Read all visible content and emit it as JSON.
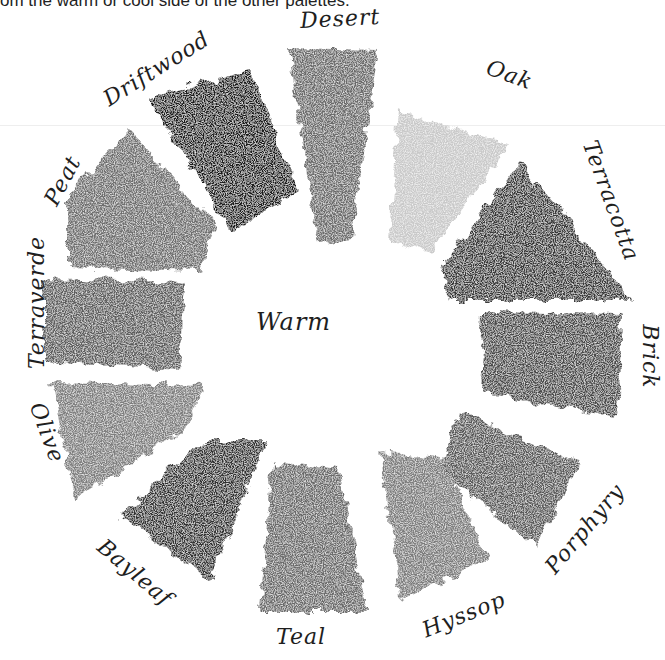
{
  "caption": "om the warm or cool side of the other palettes.",
  "center_label": "Warm",
  "swatches": [
    {
      "name": "Desert",
      "shade": "#6b6b6b"
    },
    {
      "name": "Oak",
      "shade": "#c9c9c9"
    },
    {
      "name": "Terracotta",
      "shade": "#383838"
    },
    {
      "name": "Brick",
      "shade": "#4a4a4a"
    },
    {
      "name": "Porphyry",
      "shade": "#585858"
    },
    {
      "name": "Hyssop",
      "shade": "#7b7b7b"
    },
    {
      "name": "Teal",
      "shade": "#6a6a6a"
    },
    {
      "name": "Bayleaf",
      "shade": "#323232"
    },
    {
      "name": "Olive",
      "shade": "#7e7e7e"
    },
    {
      "name": "Terraverde",
      "shade": "#5d5d5d"
    },
    {
      "name": "Peat",
      "shade": "#6e6e6e"
    },
    {
      "name": "Driftwood",
      "shade": "#1c1c1c"
    }
  ]
}
